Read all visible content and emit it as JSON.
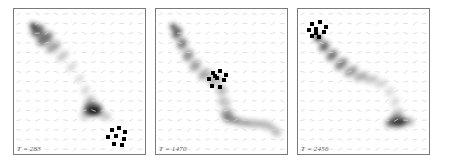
{
  "figure": {
    "background_color": "#ffffff",
    "border_color": "#7a7a7a",
    "gas_color": "#000000",
    "star_color": "#000000",
    "vector_color": "#d8d8d8",
    "panel_count": 3,
    "width": 450,
    "height": 164
  },
  "chart_data": {
    "type": "heatmap",
    "xlabel": "",
    "ylabel": "",
    "grid": true,
    "legend": "none",
    "colormap": "greys_reversed",
    "panels": [
      {
        "id": "panel-1",
        "time_label": "T = 283",
        "time_prefix": "T",
        "time_equals": "=",
        "time_value": 283,
        "vector_grid": {
          "cols": 14,
          "rows": 15,
          "glyph": "tick-arrow"
        },
        "star_cluster": {
          "count": 8,
          "centroid": [
            0.8,
            0.87
          ],
          "dots": [
            [
              0.745,
              0.836
            ],
            [
              0.8,
              0.82
            ],
            [
              0.848,
              0.845
            ],
            [
              0.72,
              0.884
            ],
            [
              0.781,
              0.876
            ],
            [
              0.838,
              0.898
            ],
            [
              0.76,
              0.93
            ],
            [
              0.822,
              0.938
            ]
          ]
        },
        "gas_blobs": [
          {
            "cx": 0.145,
            "cy": 0.115,
            "rx": 0.022,
            "ry": 0.02,
            "opacity": 0.95
          },
          {
            "cx": 0.18,
            "cy": 0.15,
            "rx": 0.055,
            "ry": 0.035,
            "opacity": 0.62,
            "rot": -38
          },
          {
            "cx": 0.235,
            "cy": 0.205,
            "rx": 0.07,
            "ry": 0.038,
            "opacity": 0.55,
            "rot": -36
          },
          {
            "cx": 0.3,
            "cy": 0.262,
            "rx": 0.062,
            "ry": 0.03,
            "opacity": 0.38,
            "rot": -35
          },
          {
            "cx": 0.37,
            "cy": 0.325,
            "rx": 0.055,
            "ry": 0.024,
            "opacity": 0.24,
            "rot": -38
          },
          {
            "cx": 0.44,
            "cy": 0.4,
            "rx": 0.048,
            "ry": 0.02,
            "opacity": 0.18,
            "rot": -42
          },
          {
            "cx": 0.5,
            "cy": 0.48,
            "rx": 0.042,
            "ry": 0.02,
            "opacity": 0.16,
            "rot": -45
          },
          {
            "cx": 0.545,
            "cy": 0.56,
            "rx": 0.04,
            "ry": 0.022,
            "opacity": 0.18,
            "rot": -55
          },
          {
            "cx": 0.58,
            "cy": 0.64,
            "rx": 0.05,
            "ry": 0.032,
            "opacity": 0.3,
            "rot": -60
          },
          {
            "cx": 0.6,
            "cy": 0.69,
            "rx": 0.075,
            "ry": 0.042,
            "opacity": 0.58,
            "rot": -8
          },
          {
            "cx": 0.61,
            "cy": 0.705,
            "rx": 0.055,
            "ry": 0.03,
            "opacity": 0.72,
            "rot": -5
          },
          {
            "cx": 0.618,
            "cy": 0.71,
            "rx": 0.034,
            "ry": 0.018,
            "opacity": 0.7,
            "rot": 0
          },
          {
            "cx": 0.69,
            "cy": 0.735,
            "rx": 0.055,
            "ry": 0.028,
            "opacity": 0.22,
            "rot": 18
          },
          {
            "cx": 0.54,
            "cy": 0.74,
            "rx": 0.04,
            "ry": 0.024,
            "opacity": 0.2,
            "rot": 0
          }
        ]
      },
      {
        "id": "panel-2",
        "time_label": "T = 1470",
        "time_prefix": "T",
        "time_equals": "=",
        "time_value": 1470,
        "vector_grid": {
          "cols": 14,
          "rows": 15,
          "glyph": "tick-arrow"
        },
        "star_cluster": {
          "count": 9,
          "centroid": [
            0.47,
            0.47
          ],
          "dots": [
            [
              0.432,
              0.443
            ],
            [
              0.487,
              0.428
            ],
            [
              0.536,
              0.452
            ],
            [
              0.405,
              0.486
            ],
            [
              0.466,
              0.479
            ],
            [
              0.521,
              0.489
            ],
            [
              0.431,
              0.528
            ],
            [
              0.489,
              0.536
            ],
            [
              0.452,
              0.462
            ]
          ]
        },
        "gas_blobs": [
          {
            "cx": 0.13,
            "cy": 0.12,
            "rx": 0.02,
            "ry": 0.018,
            "opacity": 0.95
          },
          {
            "cx": 0.16,
            "cy": 0.165,
            "rx": 0.048,
            "ry": 0.03,
            "opacity": 0.62,
            "rot": -58
          },
          {
            "cx": 0.2,
            "cy": 0.24,
            "rx": 0.045,
            "ry": 0.034,
            "opacity": 0.5,
            "rot": -62
          },
          {
            "cx": 0.245,
            "cy": 0.32,
            "rx": 0.048,
            "ry": 0.034,
            "opacity": 0.44,
            "rot": -58
          },
          {
            "cx": 0.3,
            "cy": 0.39,
            "rx": 0.05,
            "ry": 0.032,
            "opacity": 0.38,
            "rot": -48
          },
          {
            "cx": 0.37,
            "cy": 0.45,
            "rx": 0.055,
            "ry": 0.03,
            "opacity": 0.36,
            "rot": -38
          },
          {
            "cx": 0.45,
            "cy": 0.49,
            "rx": 0.06,
            "ry": 0.032,
            "opacity": 0.32,
            "rot": -22
          },
          {
            "cx": 0.5,
            "cy": 0.56,
            "rx": 0.04,
            "ry": 0.038,
            "opacity": 0.28,
            "rot": -70
          },
          {
            "cx": 0.52,
            "cy": 0.64,
            "rx": 0.035,
            "ry": 0.044,
            "opacity": 0.26,
            "rot": -80
          },
          {
            "cx": 0.54,
            "cy": 0.72,
            "rx": 0.048,
            "ry": 0.035,
            "opacity": 0.38,
            "rot": -10
          },
          {
            "cx": 0.57,
            "cy": 0.76,
            "rx": 0.06,
            "ry": 0.028,
            "opacity": 0.42,
            "rot": 6
          },
          {
            "cx": 0.65,
            "cy": 0.78,
            "rx": 0.06,
            "ry": 0.026,
            "opacity": 0.34,
            "rot": 8
          },
          {
            "cx": 0.74,
            "cy": 0.79,
            "rx": 0.062,
            "ry": 0.026,
            "opacity": 0.3,
            "rot": 6
          },
          {
            "cx": 0.84,
            "cy": 0.8,
            "rx": 0.06,
            "ry": 0.028,
            "opacity": 0.28,
            "rot": 14
          },
          {
            "cx": 0.915,
            "cy": 0.845,
            "rx": 0.045,
            "ry": 0.03,
            "opacity": 0.26,
            "rot": 40
          }
        ]
      },
      {
        "id": "panel-3",
        "time_label": "T = 2456",
        "time_prefix": "T",
        "time_equals": "=",
        "time_value": 2456,
        "vector_grid": {
          "cols": 14,
          "rows": 15,
          "glyph": "tick-arrow"
        },
        "star_cluster": {
          "count": 9,
          "centroid": [
            0.14,
            0.14
          ],
          "dots": [
            [
              0.108,
              0.1
            ],
            [
              0.168,
              0.092
            ],
            [
              0.212,
              0.122
            ],
            [
              0.082,
              0.148
            ],
            [
              0.14,
              0.14
            ],
            [
              0.196,
              0.158
            ],
            [
              0.11,
              0.186
            ],
            [
              0.16,
              0.192
            ],
            [
              0.138,
              0.168
            ]
          ]
        },
        "gas_blobs": [
          {
            "cx": 0.152,
            "cy": 0.2,
            "rx": 0.03,
            "ry": 0.024,
            "opacity": 0.8
          },
          {
            "cx": 0.2,
            "cy": 0.258,
            "rx": 0.045,
            "ry": 0.03,
            "opacity": 0.62,
            "rot": -48
          },
          {
            "cx": 0.26,
            "cy": 0.32,
            "rx": 0.05,
            "ry": 0.03,
            "opacity": 0.56,
            "rot": -44
          },
          {
            "cx": 0.33,
            "cy": 0.38,
            "rx": 0.058,
            "ry": 0.03,
            "opacity": 0.5,
            "rot": -40
          },
          {
            "cx": 0.405,
            "cy": 0.43,
            "rx": 0.058,
            "ry": 0.028,
            "opacity": 0.42,
            "rot": -32
          },
          {
            "cx": 0.48,
            "cy": 0.465,
            "rx": 0.058,
            "ry": 0.026,
            "opacity": 0.34,
            "rot": -22
          },
          {
            "cx": 0.56,
            "cy": 0.485,
            "rx": 0.055,
            "ry": 0.024,
            "opacity": 0.26,
            "rot": -14
          },
          {
            "cx": 0.635,
            "cy": 0.515,
            "rx": 0.05,
            "ry": 0.022,
            "opacity": 0.2,
            "rot": -20
          },
          {
            "cx": 0.7,
            "cy": 0.57,
            "rx": 0.042,
            "ry": 0.024,
            "opacity": 0.16,
            "rot": -42
          },
          {
            "cx": 0.74,
            "cy": 0.64,
            "rx": 0.04,
            "ry": 0.026,
            "opacity": 0.16,
            "rot": -58
          },
          {
            "cx": 0.76,
            "cy": 0.72,
            "rx": 0.048,
            "ry": 0.03,
            "opacity": 0.26,
            "rot": -25
          },
          {
            "cx": 0.76,
            "cy": 0.775,
            "rx": 0.072,
            "ry": 0.04,
            "opacity": 0.5,
            "rot": 0
          },
          {
            "cx": 0.77,
            "cy": 0.782,
            "rx": 0.052,
            "ry": 0.026,
            "opacity": 0.6,
            "rot": 0
          },
          {
            "cx": 0.7,
            "cy": 0.79,
            "rx": 0.038,
            "ry": 0.026,
            "opacity": 0.42,
            "rot": 0
          },
          {
            "cx": 0.845,
            "cy": 0.775,
            "rx": 0.04,
            "ry": 0.026,
            "opacity": 0.34,
            "rot": 6
          }
        ]
      }
    ]
  }
}
